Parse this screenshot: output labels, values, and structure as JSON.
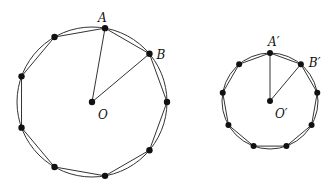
{
  "figure": {
    "large": {
      "center": [
        92,
        102
      ],
      "radius": 75,
      "vertex_count": 9,
      "start_angle_deg": -80,
      "labels": {
        "a": "A",
        "b": "B",
        "o": "O"
      }
    },
    "small": {
      "center": [
        270,
        101
      ],
      "radius": 48,
      "vertex_count": 9,
      "start_angle_deg": -90,
      "labels": {
        "a": "A′",
        "b": "B′",
        "o": "O′"
      }
    },
    "colors": {
      "stroke": "#333333",
      "dot": "#111111"
    }
  }
}
